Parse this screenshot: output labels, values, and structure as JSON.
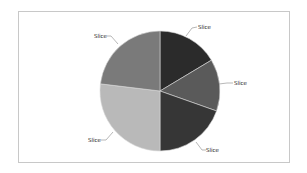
{
  "chart_data": {
    "type": "pie",
    "title": "",
    "start_angle_deg": -90,
    "direction": "clockwise",
    "categories": [
      "Slice",
      "Slice",
      "Slice",
      "Slice",
      "Slice"
    ],
    "values": [
      16.4,
      14.0,
      19.6,
      26.9,
      23.1
    ],
    "colors": [
      "#2b2b2b",
      "#5a5a5a",
      "#363636",
      "#b9b9b9",
      "#7a7a7a"
    ],
    "legend": "none",
    "data_labels": [
      "Slice",
      "Slice",
      "Slice",
      "Slice",
      "Slice"
    ]
  },
  "labels": {
    "slice1": "Slice",
    "slice2": "Slice",
    "slice3": "Slice",
    "slice4": "Slice",
    "slice5": "Slice"
  }
}
